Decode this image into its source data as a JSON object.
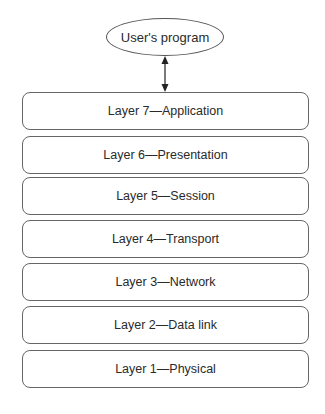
{
  "diagram": {
    "program": {
      "label": "User's program"
    },
    "connector": {
      "type": "bidirectional-arrow",
      "from": "program",
      "to": "layer-7"
    },
    "layers": [
      {
        "number": 7,
        "label": "Layer 7—Application",
        "top": 92
      },
      {
        "number": 6,
        "label": "Layer 6—Presentation",
        "top": 136
      },
      {
        "number": 5,
        "label": "Layer 5—Session",
        "top": 177
      },
      {
        "number": 4,
        "label": "Layer 4—Transport",
        "top": 220
      },
      {
        "number": 3,
        "label": "Layer 3—Network",
        "top": 263
      },
      {
        "number": 2,
        "label": "Layer 2—Data link",
        "top": 306
      },
      {
        "number": 1,
        "label": "Layer 1—Physical",
        "top": 350
      }
    ]
  }
}
